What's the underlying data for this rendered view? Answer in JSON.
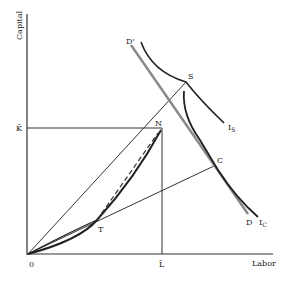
{
  "diagram": {
    "axes": {
      "y_label": "Capital",
      "x_label": "Labor",
      "origin_label": "0",
      "k_bar_label": "K̄",
      "l_bar_label": "L̄"
    },
    "points": {
      "S": "S",
      "N": "N",
      "C": "C",
      "T": "T"
    },
    "curves": {
      "budget_line_top": "D'",
      "budget_line_bottom": "D",
      "isoquant_s": "I",
      "isoquant_s_sub": "S",
      "isoquant_c": "I",
      "isoquant_c_sub": "C"
    },
    "colors": {
      "ink": "#222222",
      "budget_line": "#8a8a8a"
    }
  }
}
